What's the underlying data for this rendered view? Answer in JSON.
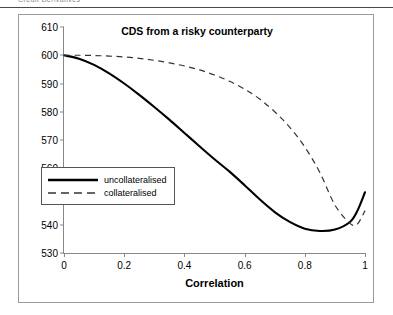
{
  "header": {
    "running_head": "Credit Derivatives"
  },
  "figure": {
    "title": "CDS from a risky counterparty"
  },
  "legend": {
    "items": [
      {
        "label": "uncollateralised",
        "style": "solid",
        "color": "#000000"
      },
      {
        "label": "collateralised",
        "style": "dashed",
        "color": "#333333"
      }
    ]
  },
  "chart_data": {
    "type": "line",
    "title": "CDS from a risky counterparty",
    "xlabel": "Correlation",
    "ylabel": "",
    "xlim": [
      0,
      1
    ],
    "ylim": [
      530,
      610
    ],
    "xticks": [
      0,
      0.2,
      0.4,
      0.6,
      0.8,
      1
    ],
    "xtick_labels": [
      "0",
      "0.2",
      "0.4",
      "0.6",
      "0.8",
      "1"
    ],
    "yticks": [
      530,
      540,
      550,
      560,
      570,
      580,
      590,
      600,
      610
    ],
    "ytick_labels": [
      "530",
      "540",
      "550",
      "560",
      "570",
      "580",
      "590",
      "600",
      "610"
    ],
    "grid": false,
    "legend_position": "center-left",
    "x": [
      0,
      0.05,
      0.1,
      0.15,
      0.2,
      0.25,
      0.3,
      0.35,
      0.4,
      0.45,
      0.5,
      0.55,
      0.6,
      0.65,
      0.7,
      0.75,
      0.8,
      0.85,
      0.9,
      0.95,
      0.975,
      1
    ],
    "series": [
      {
        "name": "uncollateralised",
        "style": "solid",
        "color": "#000000",
        "values": [
          600.0,
          598.8,
          596.6,
          593.6,
          590.0,
          586.0,
          581.7,
          577.2,
          572.5,
          567.8,
          563.2,
          558.8,
          554.0,
          549.0,
          544.5,
          541.0,
          538.6,
          537.8,
          538.3,
          541.0,
          545.0,
          551.5
        ]
      },
      {
        "name": "collateralised",
        "style": "dashed",
        "color": "#333333",
        "values": [
          600.0,
          600.0,
          599.9,
          599.7,
          599.4,
          598.9,
          598.2,
          597.3,
          596.2,
          594.8,
          593.0,
          590.8,
          588.0,
          584.5,
          580.0,
          574.5,
          567.5,
          558.5,
          547.0,
          540.5,
          540.3,
          545.0
        ]
      }
    ],
    "notes": [
      "Both curves start at 600 at correlation 0 and rise steeply toward 600 at correlation 1.",
      "Uncollateralised minimum is approximately 537.8 near correlation 0.71.",
      "Collateralised minimum is approximately 540.2 near correlation 0.90.",
      "Curves cross near correlation 0.86 around value 541."
    ]
  }
}
